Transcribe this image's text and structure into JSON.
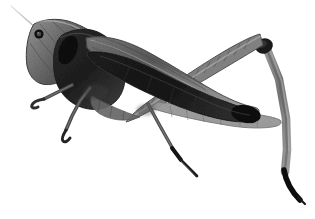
{
  "image": {
    "kind": "photograph",
    "subject": "grasshopper",
    "orientation": "facing-left",
    "rendering": "grayscale-halftone",
    "background_color": "#ffffff",
    "width_px": 315,
    "height_px": 219,
    "alt_text": "Grayscale photograph of a grasshopper facing left on a plain white background"
  },
  "palette": {
    "background": "#ffffff",
    "body_dark": "#2a2a2a",
    "body_darkest": "#141414",
    "body_mid": "#6e6e6e",
    "body_light": "#9d9d9d",
    "body_lightest": "#c4c4c4",
    "outline": "#1c1c1c",
    "antenna": "#b9b9b9",
    "tarsus_black": "#0d0d0d"
  },
  "anatomy": {
    "parts": [
      {
        "name": "antenna",
        "label": "Antenna",
        "shade": "#b9b9b9"
      },
      {
        "name": "head",
        "label": "Head",
        "shade": "#7a7a7a"
      },
      {
        "name": "compound-eye",
        "label": "Compound eye",
        "shade": "#141414"
      },
      {
        "name": "pronotum",
        "label": "Pronotum",
        "shade": "#2f2f2f"
      },
      {
        "name": "thorax",
        "label": "Thorax",
        "shade": "#3a3a3a"
      },
      {
        "name": "forewing",
        "label": "Forewing / tegmen",
        "shade": "#5a5a5a"
      },
      {
        "name": "abdomen",
        "label": "Abdomen",
        "shade": "#242424"
      },
      {
        "name": "foreleg",
        "label": "Foreleg",
        "shade": "#545454"
      },
      {
        "name": "midleg",
        "label": "Midleg",
        "shade": "#4c4c4c"
      },
      {
        "name": "hind-femur",
        "label": "Hind femur",
        "shade": "#8a8a8a"
      },
      {
        "name": "hind-knee",
        "label": "Hind knee",
        "shade": "#1a1a1a"
      },
      {
        "name": "hind-tibia",
        "label": "Hind tibia",
        "shade": "#8e8e8e"
      },
      {
        "name": "hind-tarsus",
        "label": "Hind tarsus",
        "shade": "#0d0d0d"
      }
    ]
  }
}
